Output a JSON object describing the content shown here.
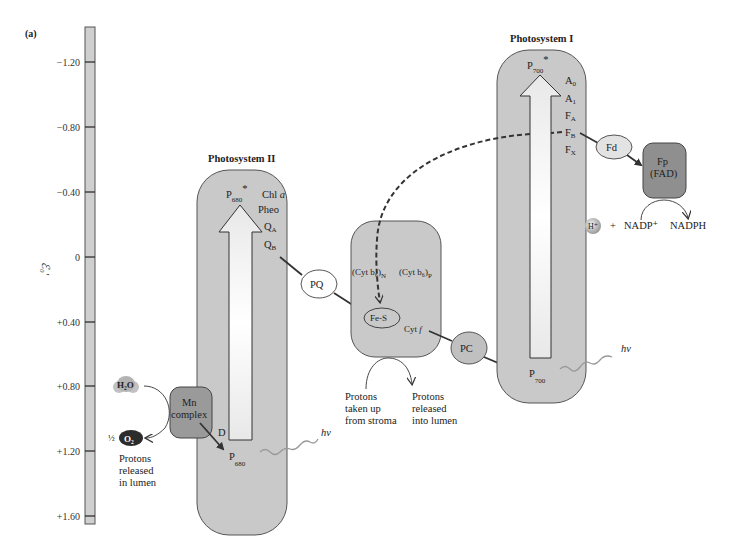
{
  "panel_label": "(a)",
  "axis": {
    "label": "ℰ₀'",
    "ticks": [
      {
        "label": "−1.20",
        "y": 62
      },
      {
        "label": "−0.80",
        "y": 127
      },
      {
        "label": "−0.40",
        "y": 192
      },
      {
        "label": "0",
        "y": 257
      },
      {
        "label": "+0.40",
        "y": 322
      },
      {
        "label": "+0.80",
        "y": 386
      },
      {
        "label": "+1.20",
        "y": 451
      },
      {
        "label": "+1.60",
        "y": 516
      }
    ]
  },
  "psII": {
    "title": "Photosystem II",
    "p680_star": "P",
    "p680_star_sub": "680",
    "star": "*",
    "chl_a": "Chl",
    "chl_a_ital": "a",
    "pheo": "Pheo",
    "qa": "Q",
    "qa_sub": "A",
    "qb": "Q",
    "qb_sub": "B",
    "d": "D",
    "p680": "P",
    "p680_sub": "680",
    "hv": "hv"
  },
  "water_side": {
    "h2o": "H₂O",
    "half": "½",
    "o2": "O₂",
    "mn_line1": "Mn",
    "mn_line2": "complex",
    "protons_line1": "Protons",
    "protons_line2": "released",
    "protons_line3": "in lumen"
  },
  "pq": "PQ",
  "cyt": {
    "cyt_bn": "(Cyt b₆)",
    "cyt_bn_sub": "N",
    "cyt_bp": "(Cyt b₆)",
    "cyt_bp_sub": "P",
    "fes": "Fe-S",
    "cytf": "Cyt",
    "cytf_ital": "f",
    "stroma_line1": "Protons",
    "stroma_line2": "taken up",
    "stroma_line3": "from stroma",
    "lumen_line1": "Protons",
    "lumen_line2": "released",
    "lumen_line3": "into lumen"
  },
  "pc": "PC",
  "psI": {
    "title": "Photosystem I",
    "p700_star": "P",
    "p700_star_sub": "700",
    "star": "*",
    "a0": "A",
    "a0_sub": "0",
    "a1": "A",
    "a1_sub": "1",
    "fa": "F",
    "fa_sub": "A",
    "fb": "F",
    "fb_sub": "B",
    "fx": "F",
    "fx_sub": "X",
    "p700": "P",
    "p700_sub": "700",
    "hv": "hv"
  },
  "nadp_side": {
    "fd": "Fd",
    "fp_line1": "Fp",
    "fp_line2": "(FAD)",
    "h_plus": "H⁺",
    "plus": "+",
    "nadp": "NADP⁺",
    "nadph": "NADPH"
  },
  "colors": {
    "box_fill": "#c9c9c9",
    "box_stroke": "#555555",
    "dark_box": "#8f8f8f",
    "arrow_fill": "#f2f2f2",
    "line": "#333333"
  }
}
